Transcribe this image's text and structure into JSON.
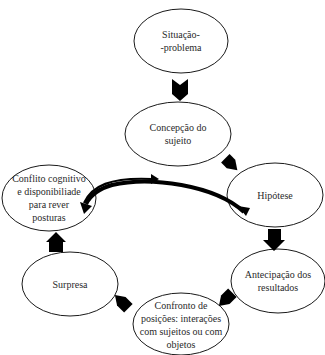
{
  "diagram": {
    "type": "cycle-flow",
    "top_clipped_text": "",
    "nodes": [
      {
        "id": "situacao",
        "lines": [
          "Situação-",
          "-problema"
        ]
      },
      {
        "id": "concepcao",
        "lines": [
          "Concepção do",
          "sujeito"
        ]
      },
      {
        "id": "hipotese",
        "lines": [
          "Hipótese"
        ]
      },
      {
        "id": "antecipacao",
        "lines": [
          "Antecipação dos",
          "resultados"
        ]
      },
      {
        "id": "confronto",
        "lines": [
          "Confronto de",
          "posições: interações",
          "com sujeitos ou com",
          "objetos"
        ]
      },
      {
        "id": "surpresa",
        "lines": [
          "Surpresa"
        ]
      },
      {
        "id": "conflito",
        "lines": [
          "Conflito cognitivo",
          "e disponibiliade",
          "para rever",
          "posturas"
        ]
      }
    ],
    "edges": [
      {
        "from": "situacao",
        "to": "concepcao",
        "style": "block-arrow"
      },
      {
        "from": "concepcao",
        "to": "hipotese",
        "style": "block-arrow"
      },
      {
        "from": "hipotese",
        "to": "antecipacao",
        "style": "block-arrow"
      },
      {
        "from": "antecipacao",
        "to": "confronto",
        "style": "block-arrow"
      },
      {
        "from": "confronto",
        "to": "surpresa",
        "style": "block-arrow"
      },
      {
        "from": "surpresa",
        "to": "conflito",
        "style": "block-arrow"
      },
      {
        "from": "conflito",
        "to": "concepcao",
        "style": "thin-curved-arrow"
      },
      {
        "from": "hipotese",
        "to": "conflito",
        "style": "thick-curved-arrow"
      }
    ],
    "colors": {
      "stroke": "#1a1a1a",
      "fill": "#ffffff",
      "text": "#2a2a2a"
    }
  }
}
